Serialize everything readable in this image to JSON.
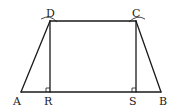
{
  "diagram": {
    "points": {
      "A": {
        "label": "A",
        "x": 21,
        "y": 92
      },
      "B": {
        "label": "B",
        "x": 161,
        "y": 92
      },
      "C": {
        "label": "C",
        "x": 136,
        "y": 21
      },
      "D": {
        "label": "D",
        "x": 50,
        "y": 21
      },
      "R": {
        "label": "R",
        "x": 50,
        "y": 92
      },
      "S": {
        "label": "S",
        "x": 136,
        "y": 92
      }
    },
    "segments": [
      "AB",
      "BC",
      "CD",
      "DA",
      "DR",
      "CS"
    ],
    "right_angles": [
      "R",
      "S"
    ],
    "arc_marks": [
      "D",
      "C"
    ],
    "colors": {
      "stroke": "#1a1a1a",
      "background": "#ffffff"
    }
  }
}
